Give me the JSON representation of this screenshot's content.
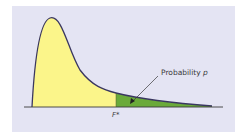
{
  "diagram": {
    "labels": {
      "probability_prefix": "Probability ",
      "probability_symbol": "p",
      "critical_value": "F*"
    },
    "colors": {
      "background": "#e4e4f3",
      "left_area": "#fbf58a",
      "tail_area": "#6aaa3a",
      "curve": "#3a3760",
      "axis": "#3a3a3a"
    }
  }
}
